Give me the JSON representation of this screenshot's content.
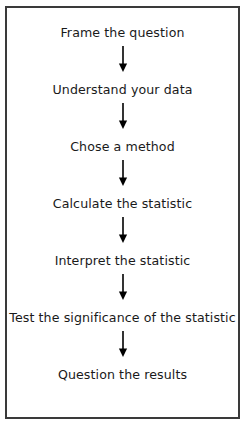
{
  "diagram": {
    "orientation": "vertical",
    "border_color": "#3a3a3a",
    "background_color": "#ffffff",
    "text_color": "#1a1a1a",
    "steps": [
      {
        "label": "Frame the question"
      },
      {
        "label": "Understand your data"
      },
      {
        "label": "Chose a method"
      },
      {
        "label": "Calculate the statistic"
      },
      {
        "label": "Interpret the statistic"
      },
      {
        "label": "Test the significance of the statistic"
      },
      {
        "label": "Question the results"
      }
    ],
    "connector": {
      "name": "down-arrow",
      "count": 6,
      "color": "#000000"
    }
  }
}
